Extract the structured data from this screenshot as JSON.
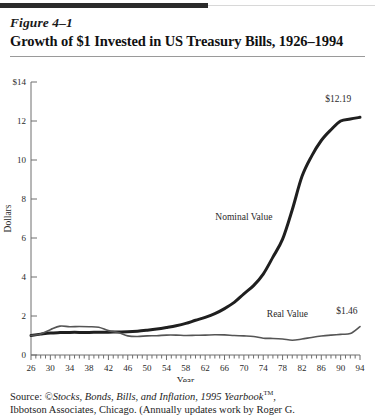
{
  "figure": {
    "number": "Figure 4–1",
    "title": "Growth of $1 Invested in US Treasury Bills, 1926–1994"
  },
  "source": {
    "prefix": "Source:",
    "copyright_symbol": "©",
    "work_title": "Stocks, Bonds, Bills, and Inflation, 1995 Yearbook",
    "trademark": "TM",
    "after_title": ",",
    "line2": "Ibbotson Associates, Chicago. (Annually updates work by Roger G."
  },
  "chart_data": {
    "type": "line",
    "title": "Growth of $1 Invested in US Treasury Bills, 1926–1994",
    "xlabel": "Year",
    "ylabel": "Dollars",
    "xlim": [
      26,
      94
    ],
    "ylim": [
      0,
      14
    ],
    "ytick_labels": [
      "$14",
      "12",
      "10",
      "8",
      "6",
      "4",
      "2",
      "0"
    ],
    "yticks": [
      14,
      12,
      10,
      8,
      6,
      4,
      2,
      0
    ],
    "xticks": [
      26,
      30,
      34,
      38,
      42,
      46,
      50,
      54,
      58,
      62,
      66,
      70,
      74,
      78,
      82,
      86,
      90,
      94
    ],
    "xtick_labels": [
      "26",
      "30",
      "34",
      "38",
      "42",
      "46",
      "50",
      "54",
      "58",
      "62",
      "66",
      "70",
      "74",
      "78",
      "82",
      "86",
      "90",
      "94"
    ],
    "grid": false,
    "legend_position": "inline-annotations",
    "annotations": [
      {
        "text": "Nominal Value",
        "x": 70,
        "y": 6.9
      },
      {
        "text": "Real Value",
        "x": 79,
        "y": 1.95
      },
      {
        "text": "$12.19",
        "x": 89.5,
        "y": 13.0
      },
      {
        "text": "$1.46",
        "x": 93.5,
        "y": 2.1
      }
    ],
    "series": [
      {
        "name": "Nominal Value",
        "color": "#1f1f1f",
        "width": 3.0,
        "x": [
          26,
          28,
          30,
          32,
          34,
          36,
          38,
          40,
          42,
          44,
          46,
          48,
          50,
          52,
          54,
          56,
          58,
          60,
          62,
          64,
          66,
          68,
          70,
          72,
          74,
          76,
          78,
          80,
          82,
          84,
          86,
          88,
          90,
          92,
          94
        ],
        "values": [
          1.0,
          1.07,
          1.13,
          1.15,
          1.16,
          1.16,
          1.16,
          1.17,
          1.17,
          1.18,
          1.19,
          1.22,
          1.27,
          1.33,
          1.41,
          1.5,
          1.62,
          1.78,
          1.93,
          2.12,
          2.38,
          2.7,
          3.14,
          3.56,
          4.15,
          5.02,
          5.94,
          7.45,
          9.15,
          10.2,
          11.0,
          11.55,
          12.0,
          12.1,
          12.19
        ]
      },
      {
        "name": "Real Value",
        "color": "#555555",
        "width": 1.6,
        "x": [
          26,
          28,
          30,
          32,
          34,
          36,
          38,
          40,
          42,
          44,
          46,
          48,
          50,
          52,
          54,
          56,
          58,
          60,
          62,
          64,
          66,
          68,
          70,
          72,
          74,
          76,
          78,
          80,
          82,
          84,
          86,
          88,
          90,
          92,
          94
        ],
        "values": [
          1.0,
          1.08,
          1.3,
          1.48,
          1.45,
          1.46,
          1.45,
          1.42,
          1.25,
          1.15,
          0.98,
          0.95,
          0.98,
          0.99,
          1.02,
          1.02,
          1.0,
          1.01,
          1.02,
          1.04,
          1.03,
          1.0,
          0.98,
          0.95,
          0.86,
          0.85,
          0.82,
          0.76,
          0.82,
          0.9,
          0.97,
          1.02,
          1.06,
          1.1,
          1.46
        ]
      }
    ]
  }
}
